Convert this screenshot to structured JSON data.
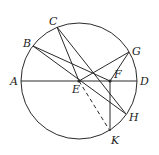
{
  "diagram": {
    "type": "circle-geometry",
    "circle": {
      "cx": 79,
      "cy": 81,
      "r": 58
    },
    "points": {
      "A": {
        "x": 21,
        "y": 81,
        "label": "A",
        "lx": 10,
        "ly": 85
      },
      "B": {
        "x": 33,
        "y": 46,
        "label": "B",
        "lx": 23,
        "ly": 47
      },
      "C": {
        "x": 57,
        "y": 27,
        "label": "C",
        "lx": 49,
        "ly": 25
      },
      "D": {
        "x": 137,
        "y": 81,
        "label": "D",
        "lx": 140,
        "ly": 85
      },
      "E": {
        "x": 79,
        "y": 81,
        "label": "E",
        "lx": 72,
        "ly": 93
      },
      "F": {
        "x": 110,
        "y": 81,
        "label": "F",
        "lx": 114,
        "ly": 78
      },
      "G": {
        "x": 129,
        "y": 52,
        "label": "G",
        "lx": 132,
        "ly": 55
      },
      "H": {
        "x": 126,
        "y": 114,
        "label": "H",
        "lx": 129,
        "ly": 121
      },
      "K": {
        "x": 110,
        "y": 131,
        "label": "K",
        "lx": 111,
        "ly": 144
      }
    },
    "segments": [
      {
        "from": "A",
        "to": "D",
        "style": "solid"
      },
      {
        "from": "B",
        "to": "F",
        "style": "solid"
      },
      {
        "from": "B",
        "to": "H",
        "style": "solid"
      },
      {
        "from": "C",
        "to": "E",
        "style": "solid"
      },
      {
        "from": "C",
        "to": "H",
        "style": "solid"
      },
      {
        "from": "E",
        "to": "G",
        "style": "solid"
      },
      {
        "from": "G",
        "to": "F",
        "style": "solid"
      },
      {
        "from": "F",
        "to": "K",
        "style": "solid"
      },
      {
        "from": "E",
        "to": "K",
        "style": "dashed"
      }
    ],
    "dots": [
      "E",
      "F"
    ],
    "stroke_color": "#2a2a2a"
  }
}
